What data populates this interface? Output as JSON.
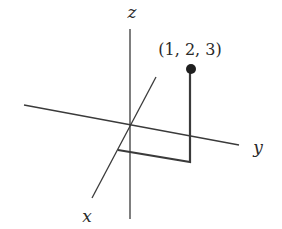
{
  "diagram": {
    "axes": [
      {
        "name": "z",
        "label": "z",
        "from": [
          130,
          29
        ],
        "to": [
          130,
          219
        ],
        "label_pos": [
          132,
          12
        ]
      },
      {
        "name": "y",
        "label": "y",
        "from": [
          24,
          105
        ],
        "to": [
          239,
          145
        ],
        "label_pos": [
          258,
          147
        ]
      },
      {
        "name": "x",
        "label": "x",
        "from": [
          156,
          77
        ],
        "to": [
          92,
          198
        ],
        "label_pos": [
          87,
          216
        ]
      }
    ],
    "point": {
      "label": "(1, 2, 3)",
      "coords": [
        1,
        2,
        3
      ],
      "position": [
        191,
        69
      ],
      "label_pos": [
        190,
        50
      ],
      "radius": 5
    },
    "projection_path": [
      [
        118,
        150
      ],
      [
        190,
        162
      ],
      [
        190,
        69
      ]
    ],
    "colors": {
      "line": "#3a3a3a",
      "text": "#2a2a2a",
      "background": "#ffffff"
    }
  }
}
